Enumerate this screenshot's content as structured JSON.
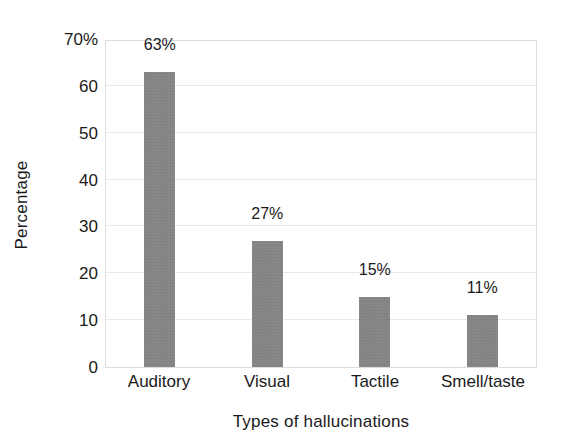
{
  "chart_data": {
    "type": "bar",
    "title": "",
    "xlabel": "Types of hallucinations",
    "ylabel": "Percentage",
    "categories": [
      "Auditory",
      "Visual",
      "Tactile",
      "Smell/taste"
    ],
    "values": [
      63,
      27,
      15,
      11
    ],
    "value_labels": [
      "63%",
      "27%",
      "15%",
      "11%"
    ],
    "ylim": [
      0,
      70
    ],
    "ytick_values": [
      70,
      60,
      50,
      40,
      30,
      20,
      10,
      0
    ],
    "ytick_labels": [
      "70%",
      "60",
      "50",
      "40",
      "30",
      "20",
      "10",
      "0"
    ],
    "grid": true,
    "legend": "none",
    "bar_color": "#858585",
    "grid_color": "#e9e9e9",
    "axis_color": "#dcdcdc",
    "text_color": "#1a1a1a",
    "background": "#ffffff"
  }
}
